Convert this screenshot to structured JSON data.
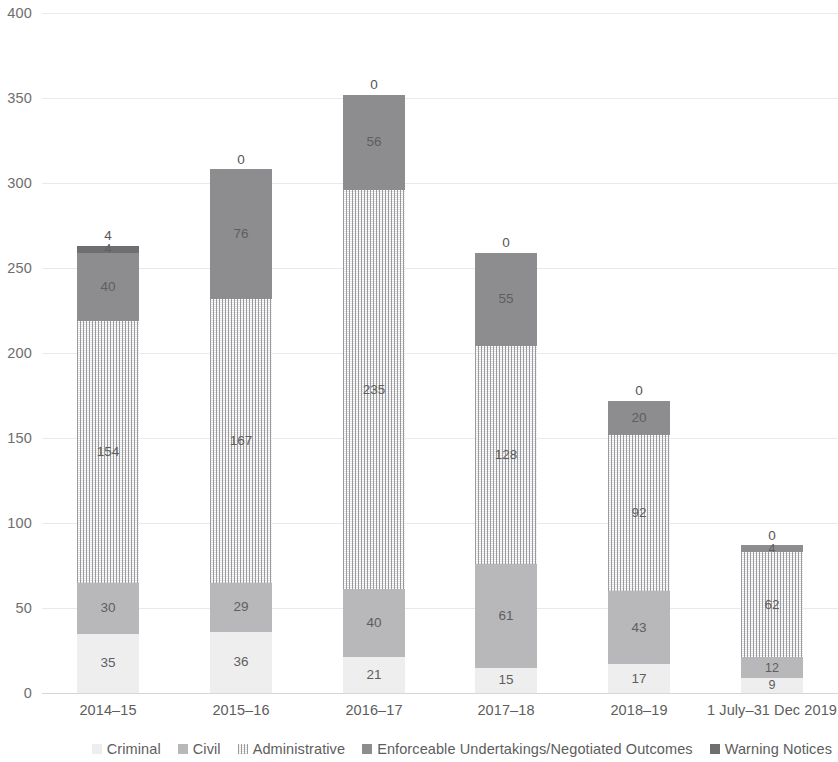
{
  "chart_data": {
    "type": "bar",
    "stacked": true,
    "orientation": "vertical",
    "title": "",
    "subtitle": "",
    "xlabel": "",
    "ylabel": "",
    "ylim": [
      0,
      400
    ],
    "ytick_step": 50,
    "yticks": [
      "400",
      "350",
      "300",
      "250",
      "200",
      "150",
      "100",
      "50",
      "0"
    ],
    "grid": "horizontal",
    "legend_position": "bottom-right",
    "categories": [
      "2014–15",
      "2015–16",
      "2016–17",
      "2017–18",
      "2018–19",
      "1 July–31 Dec 2019"
    ],
    "series": [
      {
        "name": "Criminal",
        "color": "#eeeeef",
        "values": [
          35,
          36,
          21,
          15,
          17,
          9
        ],
        "labels": [
          "35",
          "36",
          "21",
          "15",
          "17",
          "9"
        ]
      },
      {
        "name": "Civil",
        "color": "#b8b8ba",
        "values": [
          30,
          29,
          40,
          61,
          43,
          12
        ],
        "labels": [
          "30",
          "29",
          "40",
          "61",
          "43",
          "12"
        ]
      },
      {
        "name": "Administrative",
        "color": "#c9c9cc",
        "values": [
          154,
          167,
          235,
          128,
          92,
          62
        ],
        "labels": [
          "154",
          "167",
          "235",
          "128",
          "92",
          "62"
        ]
      },
      {
        "name": "Enforceable Undertakings/Negotiated Outcomes",
        "color": "#8d8d90",
        "values": [
          40,
          76,
          56,
          55,
          20,
          4
        ],
        "labels": [
          "40",
          "76",
          "56",
          "55",
          "20",
          "4"
        ]
      },
      {
        "name": "Warning Notices",
        "color": "#6f6f72",
        "values": [
          4,
          0,
          0,
          0,
          0,
          0
        ],
        "labels": [
          "4",
          "0",
          "0",
          "0",
          "0",
          "0"
        ]
      }
    ],
    "totals": [
      263,
      308,
      352,
      259,
      172,
      87
    ]
  },
  "legend": {
    "items": [
      {
        "label": "Criminal"
      },
      {
        "label": "Civil"
      },
      {
        "label": "Administrative"
      },
      {
        "label": "Enforceable Undertakings/Negotiated Outcomes"
      },
      {
        "label": "Warning Notices"
      }
    ]
  }
}
